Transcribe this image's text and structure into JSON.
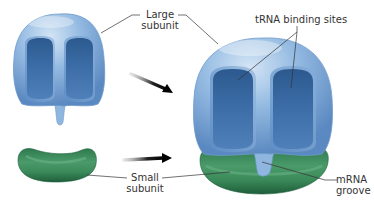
{
  "diagram": {
    "colors": {
      "large_subunit_light": "#bcd6ee",
      "large_subunit_mid": "#7ea9d6",
      "large_subunit_dark": "#3f6fa8",
      "pocket": "#2f5d93",
      "small_subunit_light": "#6fae86",
      "small_subunit_mid": "#3a8a5c",
      "small_subunit_dark": "#1f5a39",
      "arrow": "#111111",
      "leader_line": "#333333",
      "text": "#333333"
    },
    "labels": {
      "large_subunit_line1": "Large",
      "large_subunit_line2": "subunit",
      "trna_sites": "tRNA binding sites",
      "small_subunit_line1": "Small",
      "small_subunit_line2": "subunit",
      "mrna_groove_line1": "mRNA",
      "mrna_groove_line2": "groove"
    },
    "components": [
      {
        "id": "large-subunit-separate",
        "name": "Large subunit (separate)"
      },
      {
        "id": "small-subunit-separate",
        "name": "Small subunit (separate)"
      },
      {
        "id": "assembled-ribosome",
        "name": "Assembled ribosome"
      }
    ]
  }
}
